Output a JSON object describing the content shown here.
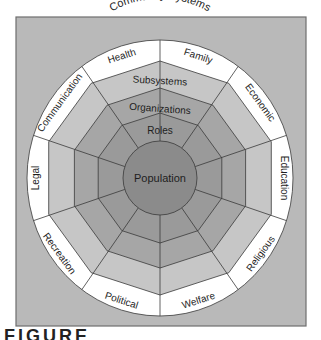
{
  "figure": {
    "caption_fragment": "FIGURE",
    "title": "Community Systems",
    "colors": {
      "frame": "#b9b9b9",
      "frame_border": "#6e6e6e",
      "outer_ring": "#ffffff",
      "subsystems_ring": "#c6c6c6",
      "organizations_ring": "#a6a6a6",
      "roles_ring": "#9a9a9a",
      "population_core": "#8b8b8b",
      "lines": "#3a3a3a"
    },
    "layers": {
      "core": "Population",
      "ring1": "Roles",
      "ring2": "Organizations",
      "ring3": "Subsystems",
      "outer": "Community Systems"
    },
    "systems": [
      "Health",
      "Communication",
      "Legal",
      "Recreation",
      "Political",
      "Welfare",
      "Religious",
      "Education",
      "Economic",
      "Family"
    ]
  }
}
